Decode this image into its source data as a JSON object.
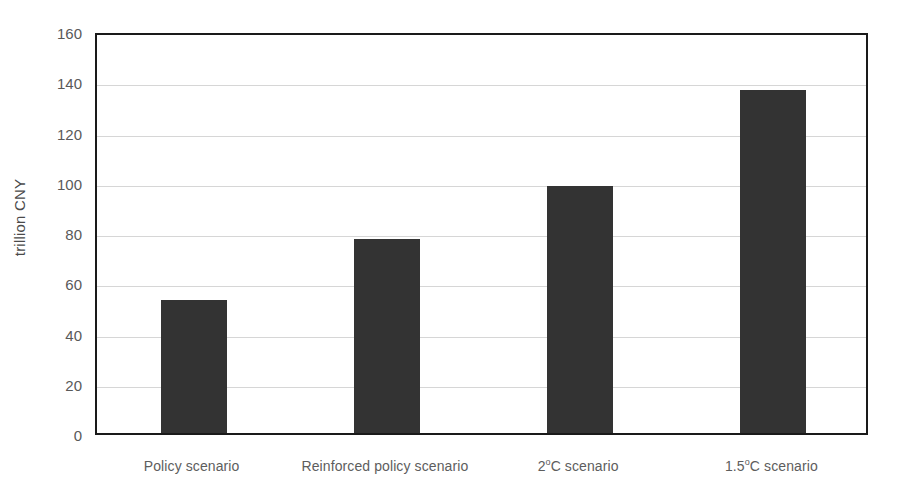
{
  "chart_data": {
    "type": "bar",
    "title": "",
    "subtitle": "",
    "xlabel": "",
    "ylabel": "trillion CNY",
    "categories": [
      "Policy scenario",
      "Reinforced policy scenario",
      "2°C scenario",
      "1.5°C scenario"
    ],
    "values": [
      53,
      77.3,
      98.5,
      136.5
    ],
    "ylim": [
      0,
      160
    ],
    "ytick_labels": [
      "0",
      "20",
      "40",
      "60",
      "80",
      "100",
      "120",
      "140",
      "160"
    ],
    "ytick_values": [
      0,
      20,
      40,
      60,
      80,
      100,
      120,
      140,
      160
    ],
    "grid": true,
    "grid_axis": "y",
    "legend": false,
    "legend_position": "none",
    "bar_color": "#333333",
    "grid_color": "#d6d6d6",
    "axis_color": "#1a1a1a",
    "tick_label_color": "#595959",
    "background_color": "#ffffff"
  },
  "axis": {
    "y_title": "trillion CNY"
  },
  "categories_display": [
    {
      "label": "Policy scenario",
      "degree": false
    },
    {
      "label": "Reinforced policy scenario",
      "degree": false
    },
    {
      "label": "2°C scenario",
      "degree": true
    },
    {
      "label": "1.5°C scenario",
      "degree": true
    }
  ]
}
